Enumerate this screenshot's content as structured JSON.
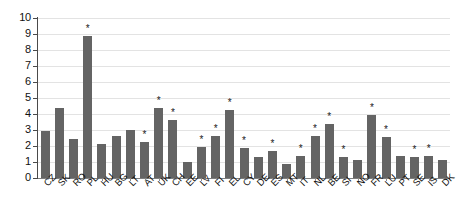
{
  "chart_data": {
    "type": "bar",
    "title": "",
    "subtitle": "",
    "xlabel": "",
    "ylabel": "",
    "ylim": [
      0,
      10
    ],
    "ytick_labels": [
      "0",
      "1",
      "2",
      "3",
      "4",
      "5",
      "6",
      "7",
      "8",
      "9",
      "10"
    ],
    "yticks": [
      0,
      1,
      2,
      3,
      4,
      5,
      6,
      7,
      8,
      9,
      10
    ],
    "grid": true,
    "legend": "none",
    "bar_color": "#646464",
    "gridline_color": "#e3e3e3",
    "axis_color": "#4a4a4a",
    "significance_marker": "*",
    "categories": [
      "CZ",
      "SK",
      "RO",
      "PL",
      "HU",
      "BG",
      "LT",
      "AT",
      "UK",
      "CH",
      "EE",
      "LV",
      "FI",
      "EL",
      "CY",
      "DE",
      "ES",
      "MT",
      "IT",
      "NL",
      "BE",
      "SI",
      "NO",
      "FR",
      "LU",
      "PT",
      "SE",
      "IS",
      "DK"
    ],
    "values": [
      2.95,
      4.35,
      2.45,
      8.85,
      2.15,
      2.65,
      3.0,
      2.25,
      4.4,
      3.65,
      1.0,
      1.95,
      2.65,
      4.25,
      1.9,
      1.3,
      1.7,
      0.9,
      1.4,
      2.6,
      3.35,
      1.3,
      1.15,
      3.95,
      2.55,
      1.4,
      1.3,
      1.4,
      1.15
    ],
    "markers": [
      false,
      false,
      false,
      true,
      false,
      false,
      false,
      true,
      true,
      true,
      false,
      true,
      true,
      true,
      true,
      false,
      true,
      false,
      true,
      true,
      true,
      true,
      false,
      true,
      true,
      false,
      true,
      true,
      false
    ]
  }
}
